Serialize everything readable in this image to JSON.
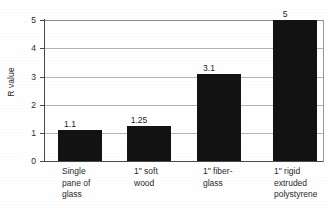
{
  "chart_data": {
    "type": "bar",
    "title": "",
    "xlabel": "",
    "ylabel": "R value",
    "ylim": [
      0,
      5
    ],
    "ytick_labels": [
      "0",
      "1",
      "2",
      "3",
      "4",
      "5"
    ],
    "ytick_values": [
      0,
      1,
      2,
      3,
      4,
      5
    ],
    "grid": true,
    "legend": "none",
    "bar_color": "#121212",
    "grid_color": "#b4b4b4",
    "axis_color": "#4a4a4a",
    "categories": [
      "Single pane of glass",
      "1\" soft wood",
      "1\" fiber-glass",
      "1\" rigid extruded polystyrene"
    ],
    "category_label_lines": [
      [
        "Single",
        "pane of",
        "glass"
      ],
      [
        "1\" soft",
        "wood"
      ],
      [
        "1\" fiber-",
        "glass"
      ],
      [
        "1\" rigid",
        "extruded",
        "polystyrene"
      ]
    ],
    "values": [
      1.1,
      1.25,
      3.1,
      5
    ],
    "value_labels": [
      "1.1",
      "1.25",
      "3.1",
      "5"
    ]
  }
}
